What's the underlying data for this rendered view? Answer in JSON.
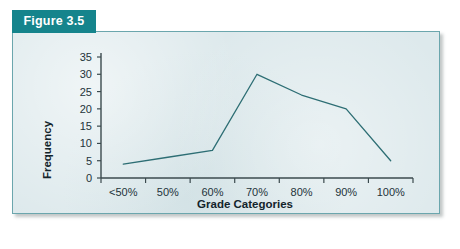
{
  "figure": {
    "tab_label": "Figure 3.5",
    "tab_color": "#15848c",
    "panel_background": "#dde9ec",
    "panel_border_color": "#6ba6ad",
    "page_background": "#ffffff"
  },
  "chart_data": {
    "type": "line",
    "title": "",
    "xlabel": "Grade Categories",
    "ylabel": "Frequency",
    "categories": [
      "<50%",
      "50%",
      "60%",
      "70%",
      "80%",
      "90%",
      "100%"
    ],
    "values": [
      4,
      6,
      8,
      30,
      24,
      20,
      5
    ],
    "series": [
      {
        "name": "Frequency",
        "values": [
          4,
          6,
          8,
          30,
          24,
          20,
          5
        ],
        "color": "#2d6e74"
      }
    ],
    "ylim": [
      0,
      35
    ],
    "yticks": [
      0,
      5,
      10,
      15,
      20,
      25,
      30,
      35
    ],
    "ytick_labels": [
      "0",
      "5",
      "10",
      "15",
      "20",
      "25",
      "30",
      "35"
    ],
    "grid": false,
    "legend": false,
    "markers": false,
    "line_color": "#2d6e74",
    "axis_color": "#3b4a4e"
  }
}
